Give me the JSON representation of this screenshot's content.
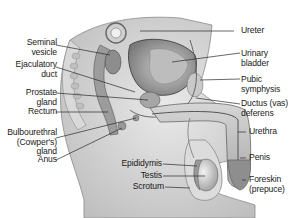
{
  "diagram": {
    "type": "anatomical illustration",
    "colors": {
      "background": "#ffffff",
      "tissue": "#cfcfcf",
      "dark_tissue": "#6e6e6e",
      "leader_line": "#2a2a2a",
      "text": "#1a1a1a"
    }
  },
  "labels_left": [
    {
      "id": "seminal-vesicle",
      "lines": [
        "Seminal",
        "vesicle"
      ]
    },
    {
      "id": "ejaculatory-duct",
      "lines": [
        "Ejaculatory",
        "duct"
      ]
    },
    {
      "id": "prostate-gland",
      "lines": [
        "Prostate",
        "gland"
      ]
    },
    {
      "id": "rectum",
      "lines": [
        "Rectum"
      ]
    },
    {
      "id": "bulbourethral-gland",
      "lines": [
        "Bulbourethral",
        "(Cowper's)",
        "gland"
      ]
    },
    {
      "id": "anus",
      "lines": [
        "Anus"
      ]
    }
  ],
  "labels_right": [
    {
      "id": "ureter",
      "lines": [
        "Ureter"
      ]
    },
    {
      "id": "urinary-bladder",
      "lines": [
        "Urinary",
        "bladder"
      ]
    },
    {
      "id": "pubic-symphysis",
      "lines": [
        "Pubic",
        "symphysis"
      ]
    },
    {
      "id": "ductus-deferens",
      "lines": [
        "Ductus (vas)",
        "deferens"
      ]
    },
    {
      "id": "urethra",
      "lines": [
        "Urethra"
      ]
    },
    {
      "id": "penis",
      "lines": [
        "Penis"
      ]
    },
    {
      "id": "foreskin",
      "lines": [
        "Foreskin",
        "(prepuce)"
      ]
    }
  ],
  "labels_bottom": [
    {
      "id": "epididymis",
      "lines": [
        "Epididymis"
      ]
    },
    {
      "id": "testis",
      "lines": [
        "Testis"
      ]
    },
    {
      "id": "scrotum",
      "lines": [
        "Scrotum"
      ]
    }
  ]
}
